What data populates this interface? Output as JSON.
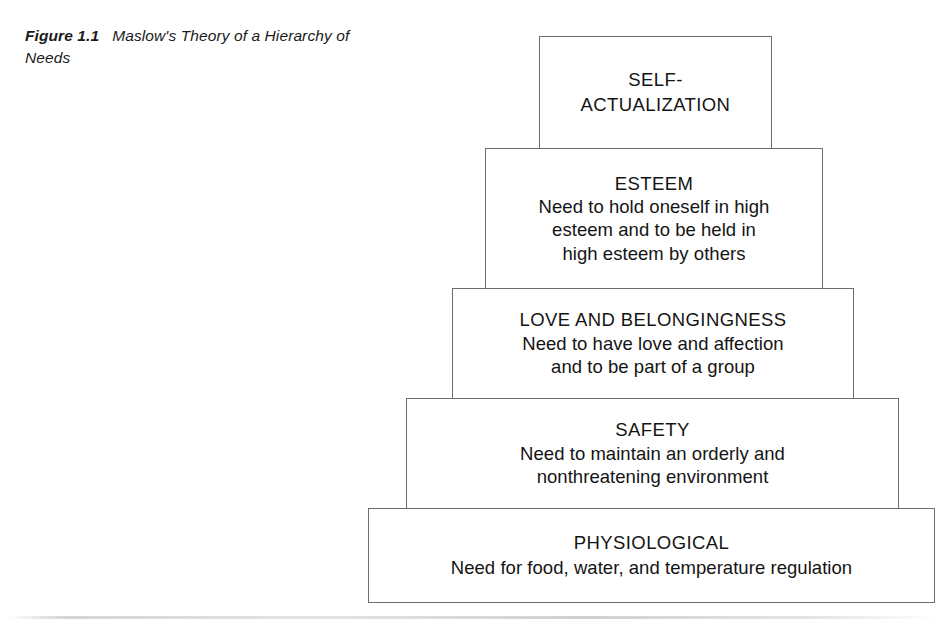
{
  "figure": {
    "label": "Figure 1.1",
    "title": "Maslow's Theory of a Hierarchy of Needs"
  },
  "diagram": {
    "type": "pyramid",
    "orientation": "widest-at-bottom",
    "border_color": "#6d6d6d",
    "background_color": "#ffffff",
    "text_color": "#141414",
    "levels": [
      {
        "rank": 5,
        "name": "self-actualization",
        "title": "SELF-\nACTUALIZATION",
        "body": ""
      },
      {
        "rank": 4,
        "name": "esteem",
        "title": "ESTEEM",
        "body": "Need to hold oneself in high\nesteem and to be held in\nhigh esteem by others"
      },
      {
        "rank": 3,
        "name": "love-and-belongingness",
        "title": "LOVE AND BELONGINGNESS",
        "body": "Need to have love and affection\nand to be part of a group"
      },
      {
        "rank": 2,
        "name": "safety",
        "title": "SAFETY",
        "body": "Need to maintain an orderly and\nnonthreatening environment"
      },
      {
        "rank": 1,
        "name": "physiological",
        "title": "PHYSIOLOGICAL",
        "body": "Need for food, water, and temperature regulation"
      }
    ]
  }
}
